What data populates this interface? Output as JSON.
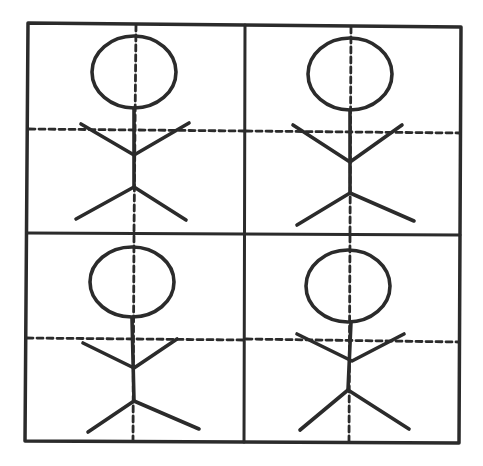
{
  "diagram": {
    "type": "grid-of-figures",
    "rows": 2,
    "cols": 2,
    "colors": {
      "line": "#2b2b2b",
      "background": "#ffffff"
    },
    "cells": [
      {
        "name": "stick-figure-top-left",
        "position": "top-left"
      },
      {
        "name": "stick-figure-top-right",
        "position": "top-right"
      },
      {
        "name": "stick-figure-bottom-left",
        "position": "bottom-left"
      },
      {
        "name": "stick-figure-bottom-right",
        "position": "bottom-right"
      }
    ]
  }
}
